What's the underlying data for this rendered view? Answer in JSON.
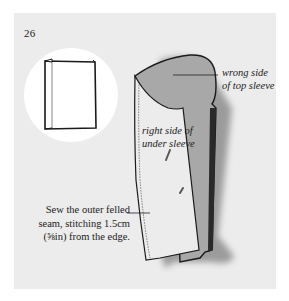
{
  "page": {
    "number": "26",
    "background_color": "#ececec",
    "margin_color": "#ffffff"
  },
  "inset": {
    "icon": "folded-fabric-book-icon",
    "circle_color": "#ffffff"
  },
  "illustration": {
    "subject": "sleeve-pieces",
    "top_sleeve_color": "#a9a9a9",
    "under_sleeve_color": "#ececec",
    "shadow_color": "#555555"
  },
  "labels": {
    "wrong_side": {
      "line1": "wrong side",
      "line2": "of top sleeve"
    },
    "right_side": {
      "line1": "right side of",
      "line2": "under sleeve"
    }
  },
  "caption": {
    "line1": "Sew the outer felled",
    "line2": "seam, stitching 1.5cm",
    "line3": "(⅝in) from the edge."
  }
}
